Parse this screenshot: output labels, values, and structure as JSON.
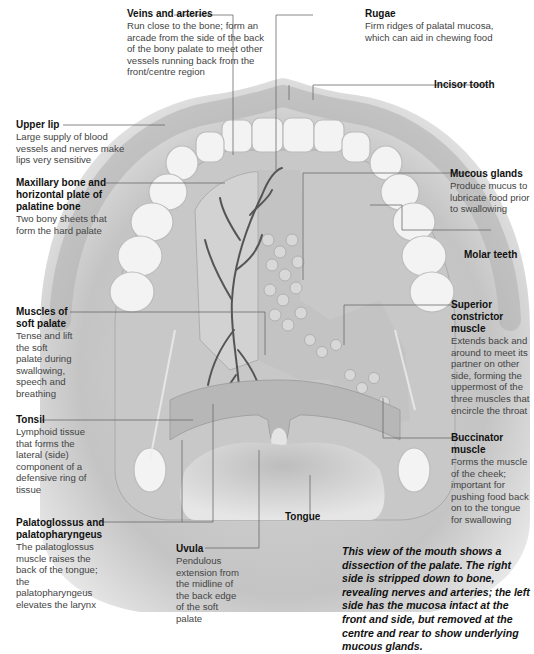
{
  "diagram": {
    "labels": [
      {
        "id": "veins-arteries",
        "title": "Veins and arteries",
        "desc": "Run close to the bone; form an arcade from the side of the back of the bony palate to meet other vessels running back from the front/centre region"
      },
      {
        "id": "rugae",
        "title": "Rugae",
        "desc": "Firm ridges of palatal mucosa, which can aid in chewing food"
      },
      {
        "id": "incisor-tooth",
        "title": "Incisor tooth",
        "desc": ""
      },
      {
        "id": "upper-lip",
        "title": "Upper lip",
        "desc": "Large supply of blood vessels and nerves make lips very sensitive"
      },
      {
        "id": "maxillary-bone",
        "title": "Maxillary bone and horizontal plate of palatine bone",
        "desc": "Two bony sheets that form the hard palate"
      },
      {
        "id": "mucous-glands",
        "title": "Mucous glands",
        "desc": "Produce mucus to lubricate food prior to swallowing"
      },
      {
        "id": "molar-teeth",
        "title": "Molar teeth",
        "desc": ""
      },
      {
        "id": "muscles-soft-palate",
        "title": "Muscles of soft palate",
        "desc": "Tense and lift the soft palate during swallowing, speech and breathing"
      },
      {
        "id": "superior-constrictor",
        "title": "Superior constrictor muscle",
        "desc": "Extends back and around to meet its partner on other side, forming the uppermost of the three muscles that encircle the throat"
      },
      {
        "id": "tonsil",
        "title": "Tonsil",
        "desc": "Lymphoid tissue that forms the lateral (side) component of a defensive ring of tissue"
      },
      {
        "id": "buccinator",
        "title": "Buccinator muscle",
        "desc": "Forms the muscle of the cheek; important for pushing food back on to the tongue for swallowing"
      },
      {
        "id": "tongue",
        "title": "Tongue",
        "desc": ""
      },
      {
        "id": "palatoglossus",
        "title": "Palatoglossus and palatopharyngeus",
        "desc": "The palatoglossus muscle raises the back of the tongue; the palatopharyngeus elevates the larynx"
      },
      {
        "id": "uvula",
        "title": "Uvula",
        "desc": "Pendulous extension from the midline of the back edge of the soft palate"
      }
    ],
    "caption": "This view of the mouth shows a dissection of the palate. The right side is stripped down to bone, revealing nerves and arteries; the left side has the mucosa intact at the front and side, but removed at the centre and rear to show underlying mucous glands.",
    "colors": {
      "tissue": "#c9c9c9",
      "tissue_dark": "#a9a9a9",
      "teeth": "#f2f2f2",
      "vessels": "#555555",
      "leader_lines": "#666666",
      "text": "#222222"
    }
  }
}
